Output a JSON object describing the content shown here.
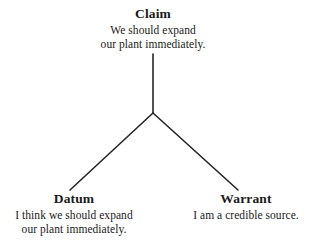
{
  "diagram": {
    "type": "toulmin-argument-model",
    "background_color": "#ffffff",
    "line_color": "#262626",
    "text_color": "#1a1a1a",
    "nodes": [
      {
        "id": "claim",
        "heading": "Claim",
        "body_lines": [
          "We should expand",
          "our plant immediately."
        ],
        "position": "top-center"
      },
      {
        "id": "datum",
        "heading": "Datum",
        "body_lines": [
          "I think we should expand",
          "our plant immediately."
        ],
        "position": "bottom-left"
      },
      {
        "id": "warrant",
        "heading": "Warrant",
        "body_lines": [
          "I am a credible source."
        ],
        "position": "bottom-right"
      }
    ],
    "connectors": [
      {
        "id": "claim-to-junction",
        "from": "claim",
        "to": "junction",
        "x1": 153,
        "y1": 54,
        "x2": 153,
        "y2": 113
      },
      {
        "id": "junction-to-datum",
        "from": "junction",
        "to": "datum",
        "x1": 153,
        "y1": 113,
        "x2": 70,
        "y2": 190
      },
      {
        "id": "junction-to-warrant",
        "from": "junction",
        "to": "warrant",
        "x1": 153,
        "y1": 113,
        "x2": 238,
        "y2": 190
      }
    ],
    "junction": {
      "x": 153,
      "y": 113
    }
  }
}
